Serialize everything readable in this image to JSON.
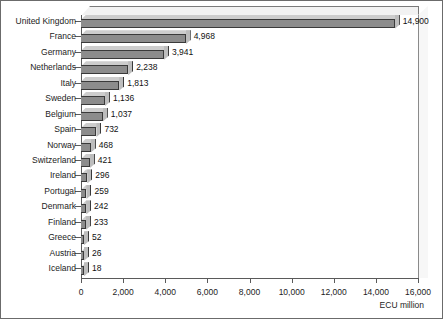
{
  "chart_data": {
    "type": "bar",
    "orientation": "horizontal",
    "title": "",
    "subtitle": "",
    "xlabel": "ECU million",
    "ylabel": "",
    "xlim": [
      0,
      16000
    ],
    "xticks": [
      "0",
      "2,000",
      "4,000",
      "6,000",
      "8,000",
      "10,000",
      "12,000",
      "14,000",
      "16,000"
    ],
    "xtick_values": [
      0,
      2000,
      4000,
      6000,
      8000,
      10000,
      12000,
      14000,
      16000
    ],
    "grid": false,
    "legend": null,
    "categories": [
      "United Kingdom",
      "France",
      "Germany",
      "Netherlands",
      "Italy",
      "Sweden",
      "Belgium",
      "Spain",
      "Norway",
      "Switzerland",
      "Ireland",
      "Portugal",
      "Denmark",
      "Finland",
      "Greece",
      "Austria",
      "Iceland"
    ],
    "values": [
      14900,
      4968,
      3941,
      2238,
      1813,
      1136,
      1037,
      732,
      468,
      421,
      296,
      259,
      242,
      233,
      52,
      26,
      18
    ],
    "value_labels": [
      "14,900",
      "4,968",
      "3,941",
      "2,238",
      "1,813",
      "1,136",
      "1,037",
      "732",
      "468",
      "421",
      "296",
      "259",
      "242",
      "233",
      "52",
      "26",
      "18"
    ],
    "colors": {
      "bar_face": "#8c8c8c",
      "bar_top": "#cdcdcd",
      "bar_side": "#6e6e6e",
      "bar_outline": "#3a3a3a",
      "axis": "#5a5a5a",
      "frame": "#6b6b6b",
      "background": "#ffffff",
      "text": "#1c1c1c"
    }
  }
}
